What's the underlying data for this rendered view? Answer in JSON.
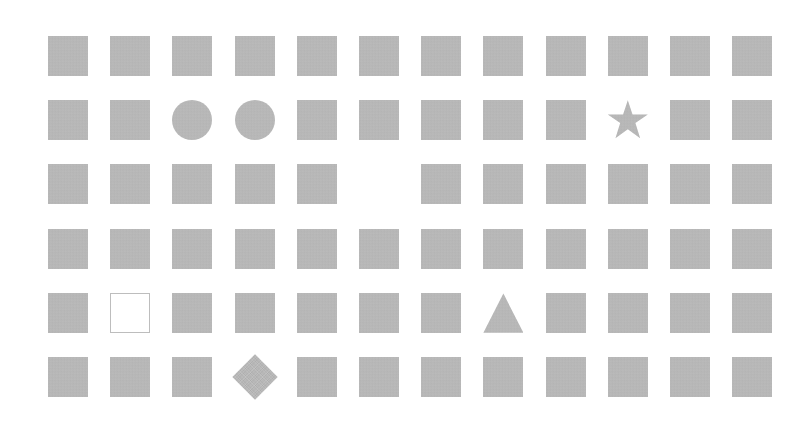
{
  "canvas": {
    "width": 809,
    "height": 445,
    "background_color": "#ffffff"
  },
  "grid": {
    "rows": 6,
    "columns": 12,
    "origin_x": 48,
    "origin_y": 36,
    "cell_size": 40,
    "column_pitch": 62.2,
    "row_pitch": 64.2,
    "fill_color": "#b9b9b9",
    "outline_color": "#bdbdbd",
    "default_shape": "square"
  },
  "legend": {
    "shape_names": {
      "square": "filled-square",
      "square-outline": "hollow-square",
      "circle": "filled-circle",
      "diamond": "filled-diamond",
      "triangle": "filled-triangle",
      "star": "filled-star",
      "empty": "empty-cell"
    }
  },
  "chart_data": {
    "type": "heatmap",
    "title": "",
    "xlabel": "",
    "ylabel": "",
    "rows": 6,
    "columns": 12,
    "categories": [
      "c1",
      "c2",
      "c3",
      "c4",
      "c5",
      "c6",
      "c7",
      "c8",
      "c9",
      "c10",
      "c11",
      "c12"
    ],
    "row_labels": [
      "r1",
      "r2",
      "r3",
      "r4",
      "r5",
      "r6"
    ],
    "cells": [
      [
        "square",
        "square",
        "square",
        "square",
        "square",
        "square",
        "square",
        "square",
        "square",
        "square",
        "square",
        "square"
      ],
      [
        "square",
        "square",
        "circle",
        "circle",
        "square",
        "square",
        "square",
        "square",
        "square",
        "star",
        "square",
        "square"
      ],
      [
        "square",
        "square",
        "square",
        "square",
        "square",
        "empty",
        "square",
        "square",
        "square",
        "square",
        "square",
        "square"
      ],
      [
        "square",
        "square",
        "square",
        "square",
        "square",
        "square",
        "square",
        "square",
        "square",
        "square",
        "square",
        "square"
      ],
      [
        "square",
        "square-outline",
        "square",
        "square",
        "square",
        "square",
        "square",
        "triangle",
        "square",
        "square",
        "square",
        "square"
      ],
      [
        "square",
        "square",
        "square",
        "diamond",
        "square",
        "square",
        "square",
        "square",
        "square",
        "square",
        "square",
        "square"
      ]
    ],
    "anomalies": [
      {
        "row": 2,
        "column": 3,
        "shape": "circle"
      },
      {
        "row": 2,
        "column": 4,
        "shape": "circle"
      },
      {
        "row": 2,
        "column": 10,
        "shape": "star"
      },
      {
        "row": 3,
        "column": 6,
        "shape": "empty"
      },
      {
        "row": 5,
        "column": 2,
        "shape": "square-outline"
      },
      {
        "row": 5,
        "column": 8,
        "shape": "triangle"
      },
      {
        "row": 6,
        "column": 4,
        "shape": "diamond"
      }
    ],
    "counts": {
      "total_cells": 72,
      "square": 64,
      "circle": 2,
      "star": 1,
      "triangle": 1,
      "diamond": 1,
      "square-outline": 1,
      "empty": 1
    },
    "grid": false,
    "legend_position": "none"
  }
}
